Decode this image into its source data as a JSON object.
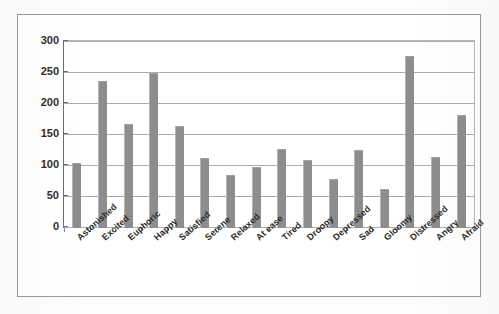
{
  "chart_data": {
    "type": "bar",
    "title": "",
    "xlabel": "",
    "ylabel": "",
    "ylim": [
      0,
      300
    ],
    "yticks": [
      0,
      50,
      100,
      150,
      200,
      250,
      300
    ],
    "grid": true,
    "legend": false,
    "legend_position": "none",
    "series_color": "#8d8d8d",
    "categories": [
      "Astonished",
      "Excited",
      "Euphoric",
      "Happy",
      "Satisfied",
      "Serene",
      "Relaxed",
      "At ease",
      "Tired",
      "Droopy",
      "Depressed",
      "Sad",
      "Gloomy",
      "Distressed",
      "Angry",
      "Afraid"
    ],
    "values": [
      105,
      237,
      167,
      250,
      165,
      113,
      85,
      98,
      128,
      110,
      79,
      126,
      63,
      278,
      115,
      182
    ]
  }
}
